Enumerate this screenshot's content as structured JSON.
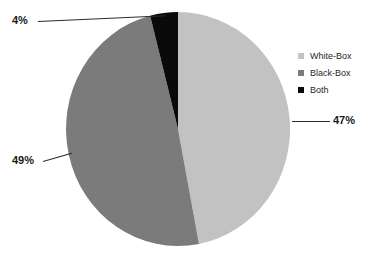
{
  "chart_data": {
    "type": "pie",
    "title": "",
    "categories": [
      "White-Box",
      "Black-Box",
      "Both"
    ],
    "values": [
      47,
      49,
      4
    ],
    "value_suffix": "%",
    "colors": [
      "#c2c2c2",
      "#7b7b7b",
      "#0a0a0a"
    ],
    "start_angle_deg": 0,
    "direction": "clockwise",
    "legend_position": "right",
    "grid": false,
    "xlabel": "",
    "ylabel": "",
    "labels": [
      {
        "text": "47%",
        "slice": "White-Box",
        "side": "right"
      },
      {
        "text": "49%",
        "slice": "Black-Box",
        "side": "left"
      },
      {
        "text": "4%",
        "slice": "Both",
        "side": "top-left"
      }
    ]
  },
  "callouts": {
    "white_box_pct": "47%",
    "black_box_pct": "49%",
    "both_pct": "4%"
  },
  "legend": {
    "items": [
      {
        "label": "White-Box",
        "color": "#c2c2c2"
      },
      {
        "label": "Black-Box",
        "color": "#7b7b7b"
      },
      {
        "label": "Both",
        "color": "#0a0a0a"
      }
    ]
  }
}
